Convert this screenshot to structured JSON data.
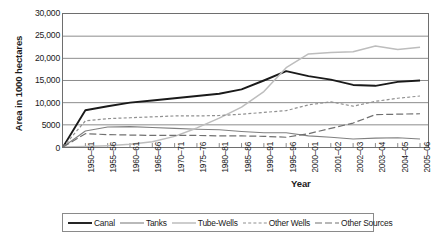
{
  "chart_data": {
    "type": "line",
    "title": "",
    "xlabel": "Year",
    "ylabel": "Area in 1000 hectares",
    "ylim": [
      0,
      30000
    ],
    "yticks": [
      0,
      5000,
      10000,
      15000,
      20000,
      25000,
      30000
    ],
    "ytick_labels": [
      "0",
      "5000",
      "10,000",
      "15,000",
      "20,000",
      "25,000",
      "30,000"
    ],
    "grid": true,
    "legend_position": "bottom",
    "categories": [
      "1950–51",
      "1955–56",
      "1960–61",
      "1965–66",
      "1970–71",
      "1975–76",
      "1980–81",
      "1985–86",
      "1990–91",
      "1995–96",
      "2000–01",
      "2001–02",
      "2002–03",
      "2003–04",
      "2004–05",
      "2005–06"
    ],
    "series": [
      {
        "name": "Canal",
        "color": "#1a1a1a",
        "style": "solid",
        "width": 1.9,
        "values": [
          8300,
          9200,
          10000,
          10500,
          11000,
          11500,
          12000,
          13000,
          15000,
          17100,
          16000,
          15200,
          14000,
          13800,
          14700,
          15000
        ]
      },
      {
        "name": "Tanks",
        "color": "#808080",
        "style": "solid",
        "width": 1.1,
        "values": [
          3600,
          4500,
          4600,
          4400,
          4200,
          4000,
          3900,
          3500,
          3200,
          3200,
          2500,
          2200,
          1800,
          2000,
          2100,
          1800
        ]
      },
      {
        "name": "Tube-Wells",
        "color": "#bdbdbd",
        "style": "solid",
        "width": 1.5,
        "values": [
          100,
          300,
          600,
          1200,
          2400,
          4300,
          6500,
          9000,
          12500,
          17900,
          21000,
          21300,
          21500,
          22800,
          22000,
          22500
        ]
      },
      {
        "name": "Other Wells",
        "color": "#909090",
        "style": "dashed-short",
        "width": 1.2,
        "values": [
          5900,
          6400,
          6600,
          6800,
          7000,
          7000,
          7100,
          7400,
          7800,
          8200,
          9500,
          10200,
          9200,
          10300,
          11000,
          11500
        ]
      },
      {
        "name": "Other Sources",
        "color": "#707070",
        "style": "dashed-long",
        "width": 1.2,
        "values": [
          3000,
          2800,
          2700,
          2600,
          2600,
          2600,
          2500,
          2500,
          2400,
          2200,
          3000,
          4200,
          5400,
          7300,
          7400,
          7500
        ]
      }
    ]
  },
  "legend": {
    "items": [
      {
        "label": "Canal"
      },
      {
        "label": "Tanks"
      },
      {
        "label": "Tube-Wells"
      },
      {
        "label": "Other Wells"
      },
      {
        "label": "Other Sources"
      }
    ]
  }
}
